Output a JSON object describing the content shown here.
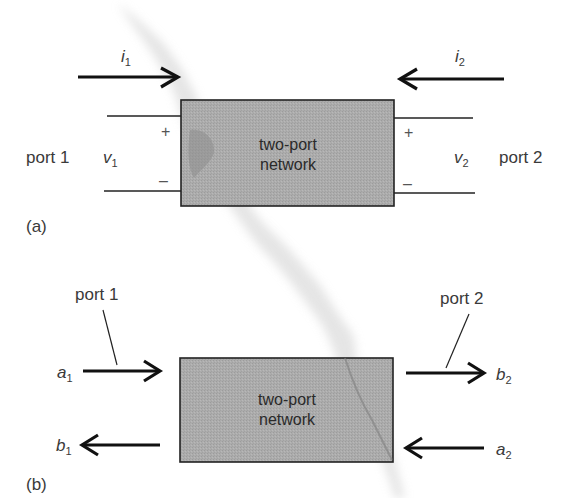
{
  "figure_a": {
    "caption": "(a)",
    "box_label_line1": "two-port",
    "box_label_line2": "network",
    "port1_label": "port 1",
    "port2_label": "port 2",
    "current_in_left": {
      "base": "i",
      "sub": "1"
    },
    "current_in_right": {
      "base": "i",
      "sub": "2"
    },
    "voltage_left": {
      "base": "v",
      "sub": "1"
    },
    "voltage_right": {
      "base": "v",
      "sub": "2"
    },
    "plus": "+",
    "minus": "–"
  },
  "figure_b": {
    "caption": "(b)",
    "box_label_line1": "two-port",
    "box_label_line2": "network",
    "port1_label": "port 1",
    "port2_label": "port 2",
    "incident_left": {
      "base": "a",
      "sub": "1"
    },
    "reflected_left": {
      "base": "b",
      "sub": "1"
    },
    "transmitted_right": {
      "base": "b",
      "sub": "2"
    },
    "incident_right": {
      "base": "a",
      "sub": "2"
    }
  },
  "colors": {
    "box_fill": "#a9a9a9",
    "line": "#222222",
    "text": "#3a3a3a"
  }
}
